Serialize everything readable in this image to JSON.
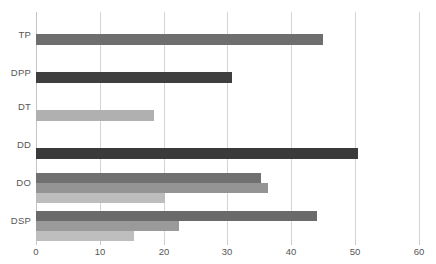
{
  "chart_data": {
    "type": "bar",
    "orientation": "horizontal",
    "title": "",
    "xlabel": "",
    "ylabel": "",
    "grid": true,
    "legend": "none",
    "xlim": [
      0,
      60
    ],
    "xticks": [
      0,
      10,
      20,
      30,
      40,
      50,
      60
    ],
    "xtick_labels": [
      "0",
      "10",
      "20",
      "30",
      "40",
      "50",
      "60"
    ],
    "categories": [
      "TP",
      "DPP",
      "DT",
      "DD",
      "DO",
      "DSP"
    ],
    "series": [
      {
        "name": "series-1",
        "color": "#636363",
        "values": [
          45.0,
          30.7,
          18.5,
          50.5,
          35.3,
          44.0
        ]
      },
      {
        "name": "series-2",
        "color": "#9d9d9d",
        "values": [
          null,
          null,
          null,
          null,
          36.4,
          22.4
        ]
      },
      {
        "name": "series-3",
        "color": "#c3c3c3",
        "values": [
          null,
          null,
          null,
          null,
          20.2,
          15.3
        ]
      }
    ],
    "bars": [
      {
        "category": "TP",
        "value": 45.0,
        "shade": "mid",
        "color": "#6e6e6e"
      },
      {
        "category": "DPP",
        "value": 30.7,
        "shade": "dark",
        "color": "#3f3f3f"
      },
      {
        "category": "DT",
        "value": 18.5,
        "shade": "light",
        "color": "#b0b0b0"
      },
      {
        "category": "DD",
        "value": 50.5,
        "shade": "dark",
        "color": "#3a3a3a"
      },
      {
        "category": "DO",
        "value": 35.3,
        "shade": "mid",
        "color": "#707070"
      },
      {
        "category": "DO",
        "value": 36.4,
        "shade": "mid2",
        "color": "#949494"
      },
      {
        "category": "DO",
        "value": 20.2,
        "shade": "light",
        "color": "#bdbdbd"
      },
      {
        "category": "DSP",
        "value": 44.0,
        "shade": "mid",
        "color": "#6a6a6a"
      },
      {
        "category": "DSP",
        "value": 22.4,
        "shade": "mid2",
        "color": "#9a9a9a"
      },
      {
        "category": "DSP",
        "value": 15.3,
        "shade": "light",
        "color": "#bebebe"
      }
    ]
  },
  "axis": {
    "x_tick_labels": [
      "0",
      "10",
      "20",
      "30",
      "40",
      "50",
      "60"
    ],
    "y_tick_labels": [
      "TP",
      "DPP",
      "DT",
      "DD",
      "DO",
      "DSP"
    ]
  },
  "colors": {
    "gridline": "#d4d4d4",
    "tick_text": "#555555",
    "plot_background": "#ffffff",
    "series_dark": "#3f3f3f",
    "series_mid": "#6e6e6e",
    "series_mid2": "#949494",
    "series_light": "#bdbdbd"
  }
}
